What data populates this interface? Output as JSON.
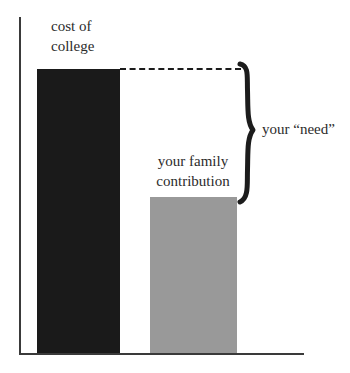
{
  "chart_data": {
    "type": "bar",
    "title": "",
    "subtitle": "",
    "xlabel": "",
    "ylabel": "",
    "grid": false,
    "legend": "none",
    "axis": {
      "x_axis_visible": true,
      "y_axis_visible": true,
      "tick_labels_x": [],
      "tick_labels_y": [],
      "ylim": [
        0,
        100
      ]
    },
    "categories": [
      "cost of college",
      "your family contribution"
    ],
    "values": [
      100,
      55
    ],
    "series": [
      {
        "name": "amount",
        "values": [
          100,
          55
        ]
      }
    ],
    "bars": [
      {
        "label": "cost of college",
        "value": 100,
        "color": "#1a1a1a"
      },
      {
        "label": "your family contribution",
        "value": 55,
        "color": "#999999"
      }
    ],
    "annotations": [
      {
        "kind": "dashed-line",
        "text": "",
        "from_value": 100,
        "note": "dashed line extends the top of the cost-of-college bar rightward"
      },
      {
        "kind": "brace",
        "text": "your “need”",
        "from_value": 55,
        "to_value": 100,
        "note": "curly brace spans the gap between family contribution and cost of college"
      }
    ]
  },
  "labels": {
    "cost_of_college": "cost of\ncollege",
    "family_contribution": "your family\ncontribution",
    "need": "your “need”"
  },
  "colors": {
    "bar_cost": "#1a1a1a",
    "bar_contribution": "#999999",
    "axis": "#3a3a3a",
    "text": "#2b2b2b",
    "background": "#ffffff"
  }
}
